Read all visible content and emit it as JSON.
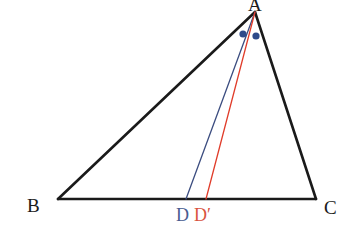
{
  "figure": {
    "kind": "geometry-diagram",
    "background_color": "#ffffff",
    "canvas": {
      "width": 353,
      "height": 234
    }
  },
  "colors": {
    "stroke_black": "#1a1a1a",
    "blue": "#3c4d80",
    "blue_label": "#4a5c90",
    "red": "#e03c2a",
    "red_label": "#d9543f",
    "dot_blue": "#2d4a8a"
  },
  "vertices": {
    "A": {
      "label": "A",
      "x": 255,
      "y": 12
    },
    "B": {
      "label": "B",
      "x": 58,
      "y": 199
    },
    "C": {
      "label": "C",
      "x": 316,
      "y": 199
    },
    "D": {
      "label": "D",
      "x": 186,
      "y": 199
    },
    "Dprime": {
      "label": "D′",
      "x": 206,
      "y": 199
    }
  },
  "segments": [
    {
      "name": "side-AB",
      "from": "A",
      "to": "B",
      "color": "#1a1a1a",
      "width": 2.6
    },
    {
      "name": "side-AC",
      "from": "A",
      "to": "C",
      "color": "#1a1a1a",
      "width": 2.6
    },
    {
      "name": "side-BC",
      "from": "B",
      "to": "C",
      "color": "#1a1a1a",
      "width": 2.6
    },
    {
      "name": "cevian-AD",
      "from": "A",
      "to": "D",
      "color": "#3c4d80",
      "width": 1.3
    },
    {
      "name": "cevian-ADprime",
      "from": "A",
      "to": "Dprime",
      "color": "#e03c2a",
      "width": 1.3
    }
  ],
  "angle_marks": [
    {
      "name": "angle-dot-left",
      "x": 243,
      "y": 34,
      "r": 3.6,
      "color": "#2d4a8a"
    },
    {
      "name": "angle-dot-right",
      "x": 256,
      "y": 36,
      "r": 3.6,
      "color": "#2d4a8a"
    }
  ],
  "labels": {
    "A": "A",
    "B": "B",
    "C": "C",
    "D": "D",
    "Dprime": "D′"
  }
}
